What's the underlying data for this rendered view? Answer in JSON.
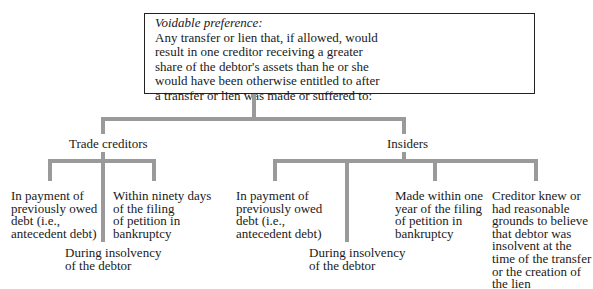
{
  "root": {
    "title": "Voidable preference:",
    "lines": [
      "Any transfer or lien that, if allowed, would",
      "result in one creditor receiving a greater",
      "share of the debtor's assets than he or she",
      "would have been otherwise entitled to after",
      "a transfer or lien was made or suffered to:"
    ]
  },
  "branches": [
    {
      "label": "Trade creditors",
      "children": [
        {
          "lines": [
            "In payment of",
            "previously owed",
            "debt (i.e.,",
            "antecedent debt)"
          ]
        },
        {
          "lines": [
            "During insolvency",
            "of the debtor"
          ]
        },
        {
          "lines": [
            "Within ninety days",
            "of the filing",
            "of petition in",
            "bankruptcy"
          ]
        }
      ]
    },
    {
      "label": "Insiders",
      "children": [
        {
          "lines": [
            "In payment of",
            "previously owed",
            "debt (i.e.,",
            "antecedent debt)"
          ]
        },
        {
          "lines": [
            "During insolvency",
            "of the debtor"
          ]
        },
        {
          "lines": [
            "Made within one",
            "year of the filing",
            "of petition in",
            "bankruptcy"
          ]
        },
        {
          "lines": [
            "Creditor knew or",
            "had reasonable",
            "grounds to believe",
            "that debtor was",
            "insolvent at the",
            "time of the transfer",
            "or the creation of",
            "the lien"
          ]
        }
      ]
    }
  ],
  "colors": {
    "connector": "#9a9a9a",
    "border": "#222222",
    "text": "#1a1a1a"
  }
}
